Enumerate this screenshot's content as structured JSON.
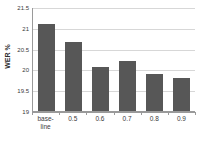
{
  "chart_data": {
    "type": "bar",
    "title": "",
    "subtitle": "",
    "xlabel": "",
    "ylabel": "WER %",
    "categories": [
      "base-line",
      "0.5",
      "0.6",
      "0.7",
      "0.8",
      "0.9"
    ],
    "category_lines": [
      [
        "base-",
        "line"
      ],
      [
        "0.5"
      ],
      [
        "0.6"
      ],
      [
        "0.7"
      ],
      [
        "0.8"
      ],
      [
        "0.9"
      ]
    ],
    "values": [
      21.1,
      20.65,
      20.05,
      20.2,
      19.9,
      19.8
    ],
    "ylim": [
      19,
      21.5
    ],
    "yticks": [
      "21.5",
      "21",
      "20.5",
      "20",
      "19.5",
      "19"
    ],
    "ytick_values": [
      21.5,
      21,
      20.5,
      20,
      19.5,
      19
    ],
    "xtick_labels": [
      "base-line",
      "0.5",
      "0.6",
      "0.7",
      "0.8",
      "0.9"
    ],
    "grid": "horizontal",
    "legend": "none",
    "annotations": [],
    "colors": {
      "bar": "#575757",
      "grid": "#d7d7d7",
      "axis": "#9a9a9a",
      "text": "#3a3a3a",
      "background": "#ffffff"
    }
  }
}
